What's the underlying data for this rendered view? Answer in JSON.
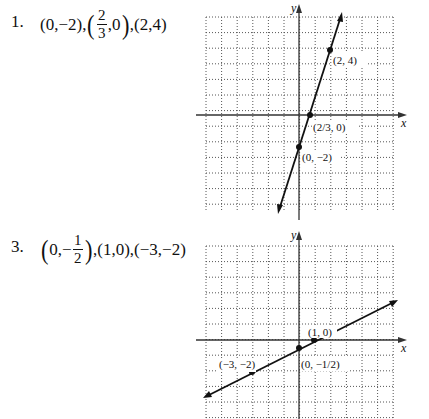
{
  "problems": [
    {
      "number": "1.",
      "points_text": {
        "p1": "(0,−2),",
        "p2_num": "2",
        "p2_den": "3",
        "p2_tail": ",0",
        "p3": ",(2,4)"
      },
      "graph": {
        "axis_x_label": "x",
        "axis_y_label": "y",
        "labels": [
          "(2, 4)",
          "(2/3, 0)",
          "(0, −2)"
        ]
      }
    },
    {
      "number": "3.",
      "points_text": {
        "p1_head": "0,−",
        "p1_num": "1",
        "p1_den": "2",
        "p2": ",(1,0),(−3,−2)"
      },
      "graph": {
        "axis_x_label": "x",
        "axis_y_label": "y",
        "labels": [
          "(1, 0)",
          "(0, −1/2)",
          "(−3, −2)"
        ]
      }
    }
  ],
  "chart_data": [
    {
      "type": "line",
      "title": "1. (0,−2), (2/3,0), (2,4)",
      "xlabel": "x",
      "ylabel": "y",
      "xlim": [
        -6,
        6
      ],
      "ylim": [
        -6,
        6
      ],
      "grid": true,
      "line": {
        "slope": 3,
        "intercept": -2,
        "equation": "y = 3x − 2"
      },
      "points": [
        {
          "x": 0,
          "y": -2,
          "label": "(0, −2)"
        },
        {
          "x": 0.6667,
          "y": 0,
          "label": "(2/3, 0)"
        },
        {
          "x": 2,
          "y": 4,
          "label": "(2, 4)"
        }
      ]
    },
    {
      "type": "line",
      "title": "3. (0,−1/2), (1,0), (−3,−2)",
      "xlabel": "x",
      "ylabel": "y",
      "xlim": [
        -6,
        6
      ],
      "ylim": [
        -5,
        6
      ],
      "grid": true,
      "line": {
        "slope": 0.5,
        "intercept": -0.5,
        "equation": "y = x/2 − 1/2"
      },
      "points": [
        {
          "x": 1,
          "y": 0,
          "label": "(1, 0)"
        },
        {
          "x": 0,
          "y": -0.5,
          "label": "(0, −1/2)"
        },
        {
          "x": -3,
          "y": -2,
          "label": "(−3, −2)"
        }
      ]
    }
  ]
}
